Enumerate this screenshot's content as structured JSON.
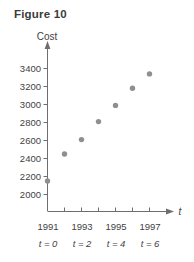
{
  "figure": {
    "title": "Figure 10",
    "y_axis_name": "Cost",
    "x_axis_name": "t"
  },
  "chart_data": {
    "type": "scatter",
    "title": "Figure 10",
    "xlabel": "t",
    "ylabel": "Cost",
    "grid": false,
    "legend": "none",
    "x": [
      0,
      1,
      2,
      3,
      4,
      5,
      6
    ],
    "x_tick_labels": [
      "1991",
      "1993",
      "1995",
      "1997"
    ],
    "x_tick_values": [
      0,
      2,
      4,
      6
    ],
    "x_sub_labels": [
      "t = 0",
      "t = 2",
      "t = 4",
      "t = 6"
    ],
    "xlim": [
      0,
      7
    ],
    "y_tick_labels": [
      "2000",
      "2200",
      "2400",
      "2600",
      "2800",
      "3000",
      "3200",
      "3400"
    ],
    "y_tick_values": [
      2000,
      2200,
      2400,
      2600,
      2800,
      3000,
      3200,
      3400
    ],
    "ylim": [
      1900,
      3500
    ],
    "values": [
      2150,
      2450,
      2610,
      2810,
      2990,
      3180,
      3340
    ],
    "series": [
      {
        "name": "Cost",
        "values": [
          2150,
          2450,
          2610,
          2810,
          2990,
          3180,
          3340
        ]
      }
    ],
    "point_color": "#8f8f8f",
    "axis_color": "#6e6e6e"
  },
  "y_ticks": [
    {
      "label": "3400",
      "value": 3400
    },
    {
      "label": "3200",
      "value": 3200
    },
    {
      "label": "3000",
      "value": 3000
    },
    {
      "label": "2800",
      "value": 2800
    },
    {
      "label": "2600",
      "value": 2600
    },
    {
      "label": "2400",
      "value": 2400
    },
    {
      "label": "2200",
      "value": 2200
    },
    {
      "label": "2000",
      "value": 2000
    }
  ],
  "x_ticks": [
    {
      "year": "1991",
      "t": "t = 0"
    },
    {
      "year": "1993",
      "t": "t = 2"
    },
    {
      "year": "1995",
      "t": "t = 4"
    },
    {
      "year": "1997",
      "t": "t = 6"
    }
  ]
}
